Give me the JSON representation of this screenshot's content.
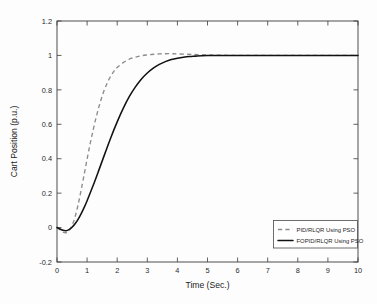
{
  "chart_data": {
    "type": "line",
    "title": "",
    "xlabel": "Time (Sec.)",
    "ylabel": "Cart Position (p.u.)",
    "xlim": [
      0,
      10
    ],
    "ylim": [
      -0.2,
      1.2
    ],
    "xticks": [
      0,
      1,
      2,
      3,
      4,
      5,
      6,
      7,
      8,
      9,
      10
    ],
    "xticklabels": [
      "0",
      "1",
      "2",
      "3",
      "4",
      "5",
      "6",
      "7",
      "8",
      "9",
      "10"
    ],
    "yticks": [
      -0.2,
      0,
      0.2,
      0.4,
      0.6,
      0.8,
      1,
      1.2
    ],
    "yticklabels": [
      "-0.2",
      "0",
      "0.2",
      "0.4",
      "0.6",
      "0.8",
      "1",
      "1.2"
    ],
    "grid": false,
    "legend_position": "lower right",
    "series": [
      {
        "name": "PID/RLQR Using PSO",
        "style": "dashed",
        "color": "#8c8c8c",
        "x": [
          0.0,
          0.1,
          0.2,
          0.3,
          0.4,
          0.5,
          0.6,
          0.7,
          0.8,
          0.9,
          1.0,
          1.1,
          1.2,
          1.3,
          1.4,
          1.5,
          1.6,
          1.7,
          1.8,
          1.9,
          2.0,
          2.2,
          2.4,
          2.6,
          2.8,
          3.0,
          3.2,
          3.4,
          3.6,
          3.8,
          4.0,
          4.5,
          5.0,
          5.5,
          6.0,
          7.0,
          8.0,
          9.0,
          10.0
        ],
        "y": [
          0.0,
          -0.012,
          -0.026,
          -0.03,
          -0.018,
          0.012,
          0.062,
          0.132,
          0.216,
          0.306,
          0.398,
          0.486,
          0.566,
          0.64,
          0.706,
          0.764,
          0.812,
          0.852,
          0.884,
          0.91,
          0.93,
          0.958,
          0.978,
          0.99,
          0.998,
          1.003,
          1.007,
          1.009,
          1.01,
          1.01,
          1.009,
          1.006,
          1.003,
          1.001,
          1.0,
          1.0,
          1.0,
          1.0,
          1.0
        ]
      },
      {
        "name": "FOPID/RLQR Using PSO",
        "style": "solid",
        "color": "#121212",
        "x": [
          0.0,
          0.1,
          0.2,
          0.3,
          0.4,
          0.5,
          0.6,
          0.7,
          0.8,
          0.9,
          1.0,
          1.2,
          1.4,
          1.6,
          1.8,
          2.0,
          2.2,
          2.4,
          2.6,
          2.8,
          3.0,
          3.2,
          3.4,
          3.6,
          3.8,
          4.0,
          4.2,
          4.4,
          4.6,
          4.8,
          5.0,
          5.5,
          6.0,
          7.0,
          8.0,
          9.0,
          10.0
        ],
        "y": [
          0.0,
          -0.008,
          -0.016,
          -0.018,
          -0.012,
          0.002,
          0.022,
          0.048,
          0.08,
          0.116,
          0.156,
          0.244,
          0.338,
          0.434,
          0.528,
          0.614,
          0.692,
          0.76,
          0.816,
          0.862,
          0.898,
          0.926,
          0.948,
          0.964,
          0.976,
          0.984,
          0.99,
          0.994,
          0.996,
          0.998,
          0.999,
          1.0,
          1.0,
          1.0,
          1.0,
          1.0,
          1.0
        ]
      }
    ],
    "legend": [
      {
        "label": "PID/RLQR Using PSO",
        "style": "dashed"
      },
      {
        "label": "FOPID/RLQR Using PSO",
        "style": "solid"
      }
    ]
  }
}
